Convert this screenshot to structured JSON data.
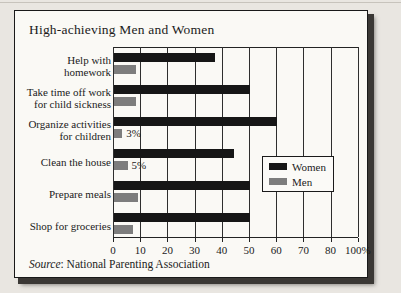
{
  "page": {
    "background_color": "#e9e6e1",
    "panel_color": "#faf9f5"
  },
  "chart_data": {
    "type": "bar",
    "orientation": "horizontal",
    "title": "High-achieving Men and Women",
    "categories": [
      "Help with\nhomework",
      "Take time off work\nfor child sickness",
      "Organize activities\nfor children",
      "Clean the house",
      "Prepare meals",
      "Shop for groceries"
    ],
    "series": [
      {
        "name": "Women",
        "color": "#161616",
        "values": [
          37,
          50,
          60,
          44,
          50,
          50
        ],
        "value_labels": [
          "",
          "",
          "",
          "",
          "",
          ""
        ]
      },
      {
        "name": "Men",
        "color": "#7d7d7d",
        "values": [
          8,
          8,
          3,
          5,
          9,
          7
        ],
        "value_labels": [
          "",
          "",
          "3%",
          "5%",
          "",
          ""
        ]
      }
    ],
    "x_ticks": [
      "0",
      "10",
      "20",
      "30",
      "40",
      "50",
      "60",
      "70",
      "80",
      "100%"
    ],
    "x_tick_values": [
      0,
      10,
      20,
      30,
      40,
      50,
      60,
      70,
      80,
      100
    ],
    "xlim": [
      0,
      100
    ],
    "grid": true,
    "legend_position": "middle-right",
    "legend": {
      "items": [
        {
          "label": "Women",
          "color": "#161616"
        },
        {
          "label": "Men",
          "color": "#7d7d7d"
        }
      ]
    },
    "source": {
      "label": "Source",
      "text": ": National Parenting Association"
    }
  }
}
